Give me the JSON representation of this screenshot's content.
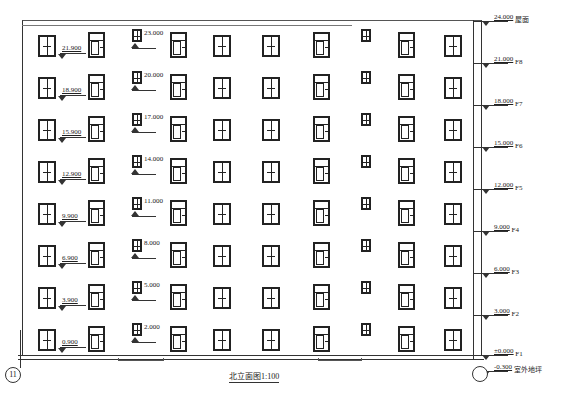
{
  "drawing": {
    "title": "北立面图1:100",
    "axis_left": "11",
    "axis_right": ""
  },
  "right_levels": [
    {
      "value": "24.000",
      "label": "屋面",
      "y": 16
    },
    {
      "value": "21.000",
      "label": "F8",
      "y": 58
    },
    {
      "value": "18.000",
      "label": "F7",
      "y": 100
    },
    {
      "value": "15.000",
      "label": "F6",
      "y": 142
    },
    {
      "value": "12.000",
      "label": "F5",
      "y": 184
    },
    {
      "value": "9.000",
      "label": "F4",
      "y": 226
    },
    {
      "value": "6.000",
      "label": "F3",
      "y": 268
    },
    {
      "value": "3.000",
      "label": "F2",
      "y": 310
    },
    {
      "value": "±0.000",
      "label": "F1",
      "y": 350
    },
    {
      "value": "-0.300",
      "label": "室外地坪",
      "y": 366
    }
  ],
  "sill_levels": [
    "21.900",
    "18.900",
    "15.900",
    "12.900",
    "9.900",
    "6.900",
    "3.900",
    "0.900"
  ],
  "small_window_levels": [
    "23.000",
    "20.000",
    "17.000",
    "14.000",
    "11.000",
    "8.000",
    "5.000",
    "2.000"
  ],
  "rows_y": [
    35,
    77,
    119,
    161,
    203,
    245,
    287,
    329
  ],
  "columns": [
    {
      "x": 38,
      "type": "double"
    },
    {
      "x": 88,
      "type": "transom"
    },
    {
      "x": 132,
      "type": "small"
    },
    {
      "x": 170,
      "type": "transom"
    },
    {
      "x": 213,
      "type": "double"
    },
    {
      "x": 262,
      "type": "double"
    },
    {
      "x": 313,
      "type": "transom"
    },
    {
      "x": 361,
      "type": "small"
    },
    {
      "x": 398,
      "type": "transom"
    },
    {
      "x": 444,
      "type": "double"
    }
  ]
}
